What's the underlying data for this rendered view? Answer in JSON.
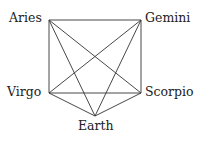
{
  "diagram": {
    "type": "graph",
    "line_color": "#333333",
    "nodes": [
      {
        "id": "aries",
        "label": "Aries",
        "x": 49,
        "y": 20
      },
      {
        "id": "gemini",
        "label": "Gemini",
        "x": 141,
        "y": 20
      },
      {
        "id": "virgo",
        "label": "Virgo",
        "x": 49,
        "y": 93
      },
      {
        "id": "scorpio",
        "label": "Scorpio",
        "x": 141,
        "y": 93
      },
      {
        "id": "earth",
        "label": "Earth",
        "x": 95,
        "y": 116
      }
    ],
    "edges": [
      [
        "aries",
        "gemini"
      ],
      [
        "aries",
        "virgo"
      ],
      [
        "aries",
        "scorpio"
      ],
      [
        "aries",
        "earth"
      ],
      [
        "gemini",
        "scorpio"
      ],
      [
        "gemini",
        "virgo"
      ],
      [
        "gemini",
        "earth"
      ],
      [
        "virgo",
        "scorpio"
      ],
      [
        "virgo",
        "earth"
      ],
      [
        "scorpio",
        "earth"
      ]
    ]
  }
}
